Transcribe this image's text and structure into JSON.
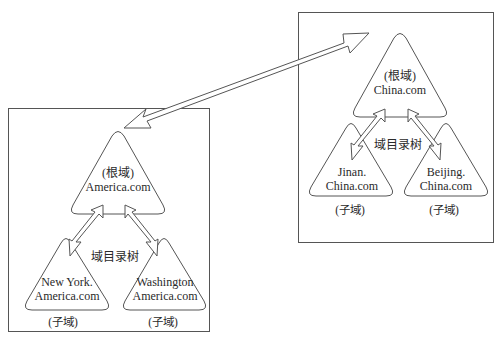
{
  "diagram": {
    "type": "domain-forest",
    "connection": {
      "label": "",
      "style": "double-headed-arrow",
      "between": [
        "America.com",
        "China.com"
      ]
    },
    "trees": [
      {
        "name": "america-tree",
        "root": {
          "role": "(根域)",
          "name": "America.com"
        },
        "tree_label": "域目录树",
        "children": [
          {
            "name_line1": "New York.",
            "name_line2": "America.com",
            "role": "(子域)"
          },
          {
            "name_line1": "Washington",
            "name_line2": "America.com",
            "role": "(子域)"
          }
        ]
      },
      {
        "name": "china-tree",
        "root": {
          "role": "(根域)",
          "name": "China.com"
        },
        "tree_label": "域目录树",
        "children": [
          {
            "name_line1": "Jinan.",
            "name_line2": "China.com",
            "role": "(子域)"
          },
          {
            "name_line1": "Beijing.",
            "name_line2": "China.com",
            "role": "(子域)"
          }
        ]
      }
    ],
    "colors": {
      "stroke": "#555555",
      "text": "#2a2a2a",
      "background": "#ffffff"
    }
  }
}
